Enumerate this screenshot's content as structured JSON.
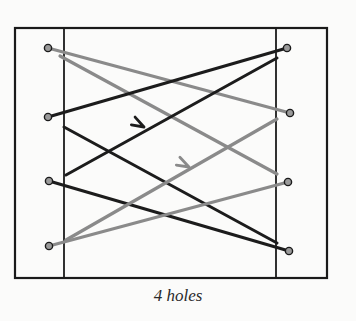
{
  "caption": "4 holes",
  "colors": {
    "background": "#fbfbfa",
    "frame": "#1a1a1a",
    "black_lace": "#1c1c1c",
    "gray_lace": "#8a8a8a"
  },
  "frame": {
    "outer": {
      "x1": 15,
      "y1": 28,
      "x2": 327,
      "y2": 278
    },
    "inner_left_x": 64,
    "inner_right_x": 276
  },
  "holes": {
    "left": [
      {
        "id": "L1",
        "x": 48,
        "y": 48
      },
      {
        "id": "L2",
        "x": 48,
        "y": 117
      },
      {
        "id": "L3",
        "x": 49,
        "y": 181
      },
      {
        "id": "L4",
        "x": 49,
        "y": 246
      }
    ],
    "right": [
      {
        "id": "R1",
        "x": 287,
        "y": 48
      },
      {
        "id": "R2",
        "x": 290,
        "y": 113
      },
      {
        "id": "R3",
        "x": 288,
        "y": 182
      },
      {
        "id": "R4",
        "x": 289,
        "y": 251
      }
    ]
  },
  "laces": [
    {
      "name": "gray-lace-l1-r2",
      "color": "gray",
      "x1": 48,
      "y1": 48,
      "x2": 290,
      "y2": 113
    },
    {
      "name": "gray-lace-l1-r3",
      "color": "gray",
      "x1": 60,
      "y1": 56,
      "x2": 277,
      "y2": 174
    },
    {
      "name": "black-lace-l2-r1",
      "color": "black",
      "x1": 48,
      "y1": 117,
      "x2": 287,
      "y2": 48
    },
    {
      "name": "black-lace-r1-l3",
      "color": "black",
      "x1": 277,
      "y1": 58,
      "x2": 66,
      "y2": 175
    },
    {
      "name": "black-lace-l2-r4",
      "color": "black",
      "x1": 64,
      "y1": 127,
      "x2": 277,
      "y2": 243
    },
    {
      "name": "black-lace-l3-r4",
      "color": "black",
      "x1": 49,
      "y1": 181,
      "x2": 289,
      "y2": 251
    },
    {
      "name": "gray-lace-r2-l4",
      "color": "gray",
      "x1": 277,
      "y1": 119,
      "x2": 66,
      "y2": 240
    },
    {
      "name": "gray-lace-l4-r3",
      "color": "gray",
      "x1": 49,
      "y1": 246,
      "x2": 288,
      "y2": 182
    }
  ],
  "arrows": [
    {
      "name": "black-direction-arrow",
      "color": "black",
      "x": 144,
      "y": 127,
      "angle": -29
    },
    {
      "name": "gray-direction-arrow",
      "color": "gray",
      "x": 189,
      "y": 167,
      "angle": -30
    }
  ]
}
